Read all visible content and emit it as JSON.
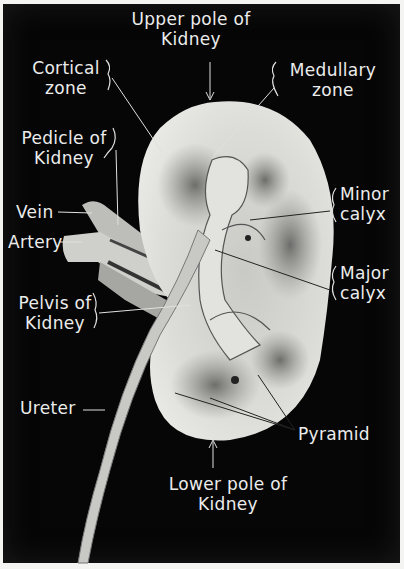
{
  "figure": {
    "background_color": "#060606",
    "label_color": "#ececec",
    "labels": {
      "upper_pole": [
        "Upper pole of",
        "Kidney"
      ],
      "cortical_zone": [
        "Cortical",
        "zone"
      ],
      "medullary_zone": [
        "Medullary",
        "zone"
      ],
      "pedicle": [
        "Pedicle of",
        "Kidney"
      ],
      "vein": "Vein",
      "artery": "Artery",
      "minor_calyx": [
        "Minor",
        "calyx"
      ],
      "major_calyx": [
        "Major",
        "calyx"
      ],
      "pelvis": [
        "Pelvis of",
        "Kidney"
      ],
      "ureter": "Ureter",
      "pyramid": "Pyramid",
      "lower_pole": [
        "Lower pole of",
        "Kidney"
      ]
    }
  }
}
